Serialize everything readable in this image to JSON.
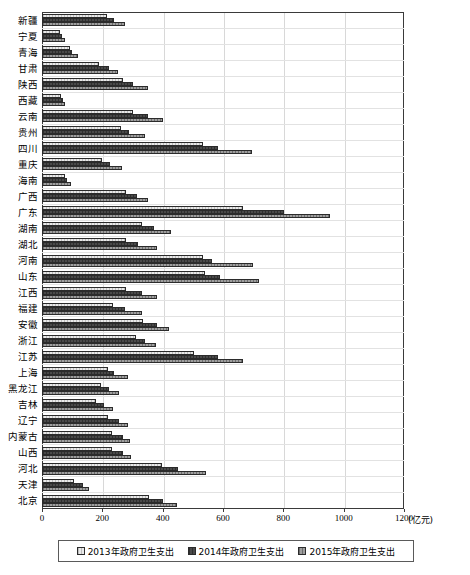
{
  "chart_data": {
    "type": "bar",
    "orientation": "horizontal",
    "title": "",
    "xlabel": "(亿元)",
    "ylabel": "",
    "xlim": [
      0,
      1200
    ],
    "xticks": [
      0,
      200,
      400,
      600,
      800,
      1000,
      1200
    ],
    "xticklabels": [
      "0",
      "200",
      "400",
      "600",
      "800",
      "1000",
      "1200"
    ],
    "grid": true,
    "legend_position": "bottom",
    "categories": [
      "新疆",
      "宁夏",
      "青海",
      "甘肃",
      "陕西",
      "西藏",
      "云南",
      "贵州",
      "四川",
      "重庆",
      "海南",
      "广西",
      "广东",
      "湖南",
      "湖北",
      "河南",
      "山东",
      "江西",
      "福建",
      "安徽",
      "浙江",
      "江苏",
      "上海",
      "黑龙江",
      "吉林",
      "辽宁",
      "内蒙古",
      "山西",
      "河北",
      "天津",
      "北京"
    ],
    "series": [
      {
        "name": "2013年政府卫生支出",
        "values": [
          216,
          61,
          92,
          189,
          268,
          62,
          303,
          262,
          533,
          199,
          75,
          280,
          666,
          330,
          277,
          533,
          539,
          280,
          234,
          336,
          310,
          504,
          218,
          195,
          180,
          220,
          233,
          232,
          398,
          105,
          354
        ]
      },
      {
        "name": "2014年政府卫生支出",
        "values": [
          239,
          67,
          101,
          222,
          300,
          70,
          350,
          290,
          583,
          225,
          83,
          316,
          802,
          372,
          318,
          563,
          589,
          330,
          274,
          380,
          340,
          584,
          240,
          222,
          206,
          254,
          268,
          267,
          450,
          135,
          402
        ]
      },
      {
        "name": "2015年政府卫生支出",
        "values": [
          275,
          76,
          118,
          253,
          351,
          77,
          400,
          341,
          696,
          265,
          96,
          350,
          955,
          426,
          380,
          700,
          720,
          381,
          330,
          422,
          379,
          665,
          286,
          256,
          235,
          286,
          292,
          295,
          545,
          157,
          447
        ]
      }
    ]
  },
  "xaxis": {
    "unit_label": "(亿元)"
  },
  "legend": {
    "items": [
      {
        "label": "2013年政府卫生支出",
        "swatch": "series-1-light-hatch"
      },
      {
        "label": "2014年政府卫生支出",
        "swatch": "series-2-dark"
      },
      {
        "label": "2015年政府卫生支出",
        "swatch": "series-3-medium-grey"
      }
    ]
  },
  "colors": {
    "series1": "#e9e9e9",
    "series2": "#4a4a4a",
    "series3": "#9e9e9e",
    "border": "#2b2b2b",
    "grid": "#d8d8d8",
    "frame": "#3a3a3a"
  }
}
